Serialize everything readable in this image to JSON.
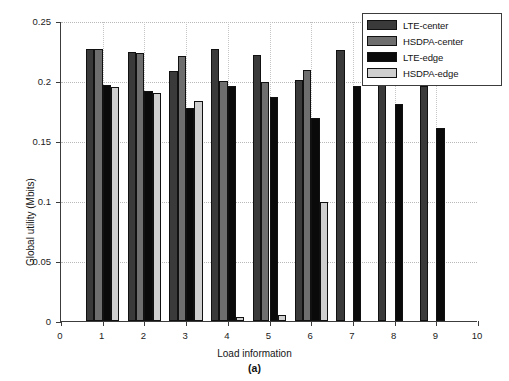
{
  "chart_data": {
    "type": "bar",
    "title": "",
    "subcaption": "(a)",
    "xlabel": "Load information",
    "ylabel": "Global utility (Mbits)",
    "xlim": [
      0,
      10
    ],
    "ylim": [
      0,
      0.25
    ],
    "xticks": [
      "0",
      "1",
      "2",
      "3",
      "4",
      "5",
      "6",
      "7",
      "8",
      "9",
      "10"
    ],
    "xtick_values": [
      0,
      1,
      2,
      3,
      4,
      5,
      6,
      7,
      8,
      9,
      10
    ],
    "yticks": [
      "0",
      "0.05",
      "0.1",
      "0.15",
      "0.2",
      "0.25"
    ],
    "ytick_values": [
      0,
      0.05,
      0.1,
      0.15,
      0.2,
      0.25
    ],
    "grid": true,
    "legend_position": "top-right",
    "categories": [
      1,
      2,
      3,
      4,
      5,
      6,
      7,
      8,
      9
    ],
    "series": [
      {
        "name": "LTE-center",
        "color": "#3a3a3a",
        "values": [
          0.2265,
          0.224,
          0.208,
          0.2265,
          0.2215,
          0.2005,
          0.226,
          0.216,
          0.196
        ]
      },
      {
        "name": "HSDPA-center",
        "color": "#6e6e6e",
        "values": [
          0.2265,
          0.223,
          0.2205,
          0.2,
          0.199,
          0.209,
          0.0,
          0.0,
          0.0
        ]
      },
      {
        "name": "LTE-edge",
        "color": "#0a0a0a",
        "values": [
          0.1965,
          0.1915,
          0.1775,
          0.196,
          0.187,
          0.169,
          0.196,
          0.1805,
          0.1605
        ]
      },
      {
        "name": "HSDPA-edge",
        "color": "#cfcfcf",
        "values": [
          0.195,
          0.19,
          0.1835,
          0.0035,
          0.005,
          0.099,
          0.0,
          0.0,
          0.0
        ]
      }
    ]
  },
  "legend": {
    "items": [
      {
        "label": "LTE-center",
        "color": "#3a3a3a"
      },
      {
        "label": "HSDPA-center",
        "color": "#6e6e6e"
      },
      {
        "label": "LTE-edge",
        "color": "#0a0a0a"
      },
      {
        "label": "HSDPA-edge",
        "color": "#cfcfcf"
      }
    ]
  }
}
